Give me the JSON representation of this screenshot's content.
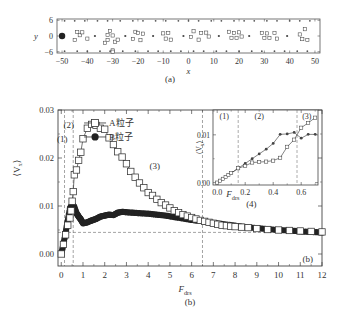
{
  "figure": {
    "panel_a_caption": "(a)",
    "panel_b_caption": "(b)",
    "panel_b_corner_label": "(b)"
  },
  "chart_data": [
    {
      "id": "panel-a",
      "type": "scatter",
      "title": "",
      "xlabel": "x",
      "ylabel": "y",
      "xlim": [
        -52,
        52
      ],
      "ylim": [
        -6.5,
        6.5
      ],
      "xticks": [
        -50,
        -40,
        -30,
        -20,
        -10,
        0,
        10,
        20,
        30,
        40,
        50
      ],
      "yticks": [
        6,
        0,
        -6
      ],
      "series": [
        {
          "name": "large-particle",
          "marker": "filled-circle-large",
          "points": [
            [
              -50,
              0
            ]
          ]
        },
        {
          "name": "A-particles",
          "marker": "open-square",
          "points": [
            [
              -45,
              -1.5
            ],
            [
              -44,
              1.5
            ],
            [
              -43,
              0.3
            ],
            [
              -42,
              1.4
            ],
            [
              -40,
              -1
            ],
            [
              -33,
              -2.6
            ],
            [
              -32,
              -1.5
            ],
            [
              -32,
              0.4
            ],
            [
              -31,
              1.9
            ],
            [
              -30,
              -5.5
            ],
            [
              -30,
              0.2
            ],
            [
              -29,
              -2.2
            ],
            [
              -28,
              -1.4
            ],
            [
              -22,
              -1.1
            ],
            [
              -21,
              1.6
            ],
            [
              -20,
              1.2
            ],
            [
              -19,
              -1.6
            ],
            [
              -18,
              0.9
            ],
            [
              -10,
              1
            ],
            [
              -9,
              -1
            ],
            [
              -8,
              1.2
            ],
            [
              -7,
              -1.4
            ],
            [
              1,
              -0.4
            ],
            [
              2,
              1.8
            ],
            [
              4,
              -1.4
            ],
            [
              5,
              1.1
            ],
            [
              7,
              1.3
            ],
            [
              8,
              -0.2
            ],
            [
              16,
              1.6
            ],
            [
              17,
              -0.7
            ],
            [
              18,
              1.1
            ],
            [
              19,
              -0.7
            ],
            [
              20,
              1.4
            ],
            [
              21,
              -0.2
            ],
            [
              29,
              1.2
            ],
            [
              30,
              -0.8
            ],
            [
              31,
              1
            ],
            [
              32,
              -0.8
            ],
            [
              34,
              1.2
            ],
            [
              35,
              -1
            ],
            [
              44,
              0.6
            ],
            [
              45,
              -1.2
            ],
            [
              46,
              2.6
            ],
            [
              47,
              -1.5
            ],
            [
              -30,
              -6
            ]
          ]
        },
        {
          "name": "B-particles",
          "marker": "filled-dot",
          "points": [
            [
              -37,
              0
            ],
            [
              -25,
              0
            ],
            [
              -14,
              0
            ],
            [
              -2,
              0
            ],
            [
              12,
              0
            ],
            [
              24,
              0
            ],
            [
              39,
              0
            ]
          ]
        },
        {
          "name": "wall-top",
          "marker": "filled-dot-small",
          "points": [
            [
              -49,
              5.8
            ],
            [
              -45,
              5.8
            ],
            [
              -41,
              5.8
            ],
            [
              -36,
              5.8
            ],
            [
              -32,
              5.8
            ],
            [
              -27,
              5.8
            ],
            [
              -22,
              5.8
            ],
            [
              -18,
              5.8
            ],
            [
              -13,
              5.8
            ],
            [
              -9,
              5.8
            ],
            [
              -4,
              5.8
            ],
            [
              0,
              5.8
            ],
            [
              4,
              5.8
            ],
            [
              9,
              5.8
            ],
            [
              13,
              5.8
            ],
            [
              18,
              5.8
            ],
            [
              22,
              5.8
            ],
            [
              26,
              5.8
            ],
            [
              31,
              5.8
            ],
            [
              35,
              5.8
            ],
            [
              40,
              5.8
            ],
            [
              44,
              5.8
            ],
            [
              48,
              5.8
            ]
          ]
        },
        {
          "name": "wall-bottom",
          "marker": "filled-dot-small",
          "points": [
            [
              -49,
              -5.8
            ],
            [
              -44,
              -5.8
            ],
            [
              -40,
              -5.8
            ],
            [
              -35,
              -5.8
            ],
            [
              -31,
              -5.8
            ],
            [
              -26,
              -5.8
            ],
            [
              -21,
              -5.8
            ],
            [
              -16,
              -5.8
            ],
            [
              -12,
              -5.8
            ],
            [
              -7,
              -5.8
            ],
            [
              -3,
              -5.8
            ],
            [
              2,
              -5.8
            ],
            [
              6,
              -5.8
            ],
            [
              11,
              -5.8
            ],
            [
              15,
              -5.8
            ],
            [
              20,
              -5.8
            ],
            [
              25,
              -5.8
            ],
            [
              29,
              -5.8
            ],
            [
              34,
              -5.8
            ],
            [
              38,
              -5.8
            ],
            [
              43,
              -5.8
            ],
            [
              47,
              -5.8
            ]
          ]
        }
      ]
    },
    {
      "id": "panel-b-main",
      "type": "line",
      "title": "",
      "xlabel": "F_drs",
      "ylabel": "⟨V_x⟩",
      "xlim": [
        -0.15,
        12
      ],
      "ylim": [
        -0.0025,
        0.03
      ],
      "xticks": [
        0,
        1,
        2,
        3,
        4,
        5,
        6,
        7,
        8,
        9,
        10,
        11,
        12
      ],
      "yticks": [
        0.0,
        0.01,
        0.02,
        0.03
      ],
      "ytick_labels": [
        "0.00",
        "0.01",
        "0.02",
        "0.03"
      ],
      "legend": {
        "position": "upper-center",
        "entries": [
          {
            "label": "A粒子",
            "marker": "open-square"
          },
          {
            "label": "B粒子",
            "marker": "filled-circle"
          }
        ]
      },
      "annotations": [
        {
          "text": "(1)",
          "x": 0.05,
          "y": 0.0234
        },
        {
          "text": "(2)",
          "x": 0.35,
          "y": 0.0262
        },
        {
          "text": "(3)",
          "x": 4.3,
          "y": 0.0178
        },
        {
          "text": "(4)",
          "x": 8.75,
          "y": 0.0098
        }
      ],
      "reference_lines": {
        "vertical": [
          0.15,
          0.55,
          6.5
        ],
        "horizontal": [
          0.0045
        ]
      },
      "series": [
        {
          "name": "A粒子",
          "marker": "open-square",
          "x": [
            0.0,
            0.1,
            0.2,
            0.3,
            0.4,
            0.45,
            0.5,
            0.55,
            0.6,
            0.7,
            0.8,
            0.9,
            1.0,
            1.2,
            1.4,
            1.6,
            1.8,
            2.0,
            2.2,
            2.4,
            2.6,
            2.8,
            3.0,
            3.2,
            3.4,
            3.6,
            3.8,
            4.0,
            4.2,
            4.4,
            4.6,
            4.8,
            5.0,
            5.2,
            5.4,
            5.6,
            5.8,
            6.0,
            6.2,
            6.4,
            6.6,
            6.8,
            7.0,
            7.2,
            7.4,
            7.6,
            7.8,
            8.0,
            8.3,
            8.6,
            9.0,
            9.5,
            10.0,
            10.5,
            11.0,
            11.5,
            12.0
          ],
          "values": [
            0.0,
            0.002,
            0.004,
            0.006,
            0.0075,
            0.009,
            0.011,
            0.013,
            0.0165,
            0.0175,
            0.0195,
            0.0212,
            0.024,
            0.0262,
            0.027,
            0.0268,
            0.0262,
            0.026,
            0.0242,
            0.0228,
            0.0213,
            0.0202,
            0.0188,
            0.0172,
            0.016,
            0.0148,
            0.0138,
            0.0128,
            0.0122,
            0.0114,
            0.0107,
            0.0102,
            0.0096,
            0.009,
            0.0086,
            0.0082,
            0.0079,
            0.0076,
            0.0073,
            0.007,
            0.0068,
            0.0066,
            0.0064,
            0.0062,
            0.006,
            0.0059,
            0.0058,
            0.0057,
            0.0056,
            0.0055,
            0.0053,
            0.0051,
            0.005,
            0.0049,
            0.0048,
            0.0047,
            0.0046
          ]
        },
        {
          "name": "B粒子",
          "marker": "filled-circle",
          "x": [
            0.0,
            0.1,
            0.2,
            0.3,
            0.4,
            0.5,
            0.6,
            0.7,
            0.8,
            0.9,
            1.0,
            1.2,
            1.4,
            1.6,
            1.8,
            2.0,
            2.2,
            2.4,
            2.6,
            2.8,
            3.0,
            3.3,
            3.6,
            4.0,
            4.4,
            4.8,
            5.2,
            5.6,
            6.0,
            6.5,
            7.0,
            7.5,
            8.0,
            8.5,
            9.0,
            9.5,
            10.0,
            10.5,
            11.0,
            11.5,
            12.0
          ],
          "values": [
            0.0,
            0.002,
            0.0045,
            0.007,
            0.0095,
            0.0103,
            0.0098,
            0.0085,
            0.0078,
            0.0072,
            0.0064,
            0.0066,
            0.007,
            0.0073,
            0.0078,
            0.008,
            0.0082,
            0.0081,
            0.0086,
            0.0088,
            0.0087,
            0.0086,
            0.0085,
            0.0084,
            0.0082,
            0.008,
            0.0077,
            0.0074,
            0.0071,
            0.0068,
            0.0065,
            0.0062,
            0.0059,
            0.0056,
            0.0054,
            0.0052,
            0.005,
            0.0049,
            0.0047,
            0.0046,
            0.0045
          ]
        }
      ]
    },
    {
      "id": "panel-b-inset",
      "type": "line",
      "title": "",
      "xlabel": "F_drs",
      "ylabel": "⟨V_x⟩",
      "xlim": [
        -0.03,
        0.72
      ],
      "ylim": [
        -0.0005,
        0.0152
      ],
      "xticks": [
        0.0,
        0.2,
        0.4,
        0.6
      ],
      "xtick_labels": [
        "0.0",
        "0.2",
        "0.4",
        "0.6"
      ],
      "yticks": [
        0.0,
        0.01
      ],
      "ytick_labels": [
        "0.00",
        "0.01"
      ],
      "annotations": [
        {
          "text": "(1)",
          "x": 0.05,
          "y": 0.0134
        },
        {
          "text": "(2)",
          "x": 0.3,
          "y": 0.0134
        },
        {
          "text": "(3)",
          "x": 0.64,
          "y": 0.0134
        }
      ],
      "reference_lines": {
        "vertical": [
          0.15,
          0.57
        ]
      },
      "series": [
        {
          "name": "A粒子",
          "marker": "open-square",
          "x": [
            0.0,
            0.02,
            0.04,
            0.06,
            0.08,
            0.1,
            0.15,
            0.2,
            0.25,
            0.3,
            0.35,
            0.4,
            0.45,
            0.5,
            0.55,
            0.6,
            0.65,
            0.7
          ],
          "values": [
            0.0,
            0.0004,
            0.0008,
            0.0012,
            0.0016,
            0.002,
            0.003,
            0.0035,
            0.0042,
            0.0043,
            0.0044,
            0.0046,
            0.0052,
            0.0075,
            0.009,
            0.0115,
            0.0125,
            0.0136
          ]
        },
        {
          "name": "B粒子",
          "marker": "filled-circle",
          "x": [
            0.0,
            0.02,
            0.04,
            0.06,
            0.08,
            0.1,
            0.15,
            0.2,
            0.25,
            0.3,
            0.35,
            0.4,
            0.45,
            0.5,
            0.55,
            0.6,
            0.65,
            0.7
          ],
          "values": [
            0.0,
            0.0004,
            0.0008,
            0.0012,
            0.0016,
            0.002,
            0.003,
            0.004,
            0.005,
            0.006,
            0.007,
            0.0082,
            0.0101,
            0.0102,
            0.0105,
            0.0093,
            0.0101,
            0.0101
          ]
        }
      ]
    }
  ]
}
